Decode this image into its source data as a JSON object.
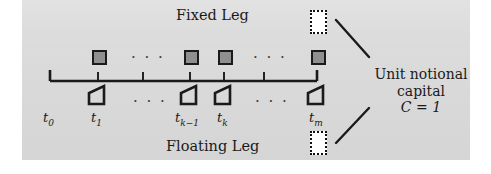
{
  "figure": {
    "title_fixed": "Fixed Leg",
    "title_floating": "Floating Leg",
    "background_color": "#dcdcdc",
    "line_color": "#1a1a1a",
    "coupon_fill_color": "#8f8f8f"
  },
  "annotation": {
    "line1": "Unit notional",
    "line2": "capital",
    "line3_symbol": "C",
    "line3_relation": "=",
    "line3_value": "1"
  },
  "ellipsis": {
    "fixed_left": "· · ·",
    "fixed_right": "· · ·",
    "floating_left": "· · ·",
    "floating_right": "· · ·"
  },
  "timeline": {
    "axis_start_x": 50,
    "axis_end_x": 317,
    "ticks": [
      {
        "id": "t0",
        "base": "t",
        "sub": "0",
        "x": 50
      },
      {
        "id": "t1",
        "base": "t",
        "sub": "1",
        "x": 98
      },
      {
        "id": "tmid1",
        "base": "",
        "sub": "",
        "x": 143
      },
      {
        "id": "tk-1",
        "base": "t",
        "sub": "k−1",
        "x": 190
      },
      {
        "id": "tk",
        "base": "t",
        "sub": "k",
        "x": 224
      },
      {
        "id": "tmid2",
        "base": "",
        "sub": "",
        "x": 264
      },
      {
        "id": "tm",
        "base": "t",
        "sub": "m",
        "x": 317
      }
    ],
    "labels": [
      {
        "base": "t",
        "sub": "0",
        "x": 50
      },
      {
        "base": "t",
        "sub": "1",
        "x": 98
      },
      {
        "base": "t",
        "sub": "k−1",
        "x": 190
      },
      {
        "base": "t",
        "sub": "k",
        "x": 224
      },
      {
        "base": "t",
        "sub": "m",
        "x": 317
      }
    ]
  },
  "fixed_payments": [
    {
      "x": 98
    },
    {
      "x": 190
    },
    {
      "x": 224
    },
    {
      "x": 317
    }
  ],
  "floating_payments": [
    {
      "x": 98
    },
    {
      "x": 190
    },
    {
      "x": 224
    },
    {
      "x": 317
    }
  ],
  "notional_boxes": [
    {
      "name": "fixed-notional",
      "x": 310,
      "y": 10
    },
    {
      "name": "floating-notional",
      "x": 310,
      "y": 131
    }
  ]
}
